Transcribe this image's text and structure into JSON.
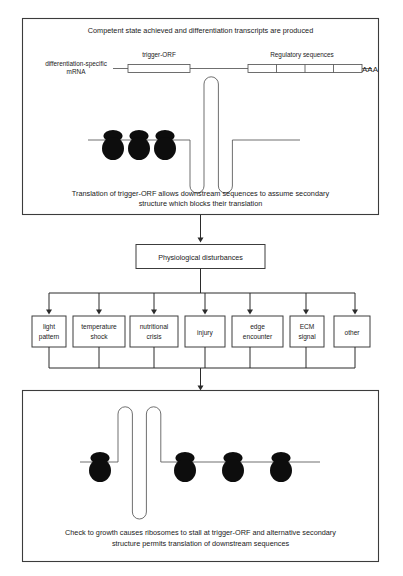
{
  "figure": {
    "background_color": "#ffffff",
    "line_color": "#555555",
    "frame_color": "#3c3c3c",
    "ribosome_color": "#0d0d0d",
    "connector_color": "#2b2b2b"
  },
  "top_panel": {
    "heading": "Competent state achieved and differentiation transcripts are produced",
    "mrna_label_line1": "differentiation-specific",
    "mrna_label_line2": "mRNA",
    "trigger_orf_label": "trigger-ORF",
    "regulatory_label": "Regulatory sequences",
    "poly_a_label": "AAA",
    "regulatory_segments": 4,
    "ribosome_count": 3,
    "hairpin_up_count": 1,
    "hairpin_down_count": 2,
    "caption_line1": "Translation of trigger-ORF allows downstream sequences to assume secondary",
    "caption_line2": "structure which blocks their translation"
  },
  "middle": {
    "center_box_label": "Physiological disturbances",
    "stressors": [
      {
        "label_line1": "light",
        "label_line2": "pattern"
      },
      {
        "label_line1": "temperature",
        "label_line2": "shock"
      },
      {
        "label_line1": "nutritional",
        "label_line2": "crisis"
      },
      {
        "label_line1": "injury",
        "label_line2": ""
      },
      {
        "label_line1": "edge",
        "label_line2": "encounter"
      },
      {
        "label_line1": "ECM",
        "label_line2": "signal"
      },
      {
        "label_line1": "other",
        "label_line2": ""
      }
    ]
  },
  "bottom_panel": {
    "ribosome_count": 4,
    "hairpin_up_count": 2,
    "hairpin_down_count": 1,
    "caption_line1": "Check to growth causes ribosomes to stall at trigger-ORF and alternative secondary",
    "caption_line2": "structure permits translation of downstream sequences"
  }
}
